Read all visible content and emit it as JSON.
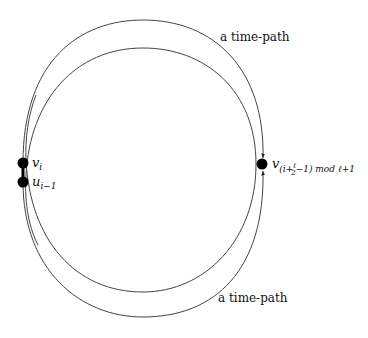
{
  "diagram": {
    "nodes": [
      {
        "id": "v_i",
        "label": "v",
        "sub": "i",
        "x": 23,
        "y": 163
      },
      {
        "id": "u_i-1",
        "label": "u",
        "sub": "i−1",
        "x": 23,
        "y": 182
      },
      {
        "id": "v_right",
        "label": "v",
        "sub": "(i+ℓ/2−1) mod ℓ+1",
        "x": 262,
        "y": 164
      }
    ],
    "edges": [
      {
        "from": "v_i",
        "to": "u_i-1",
        "style": "thick"
      }
    ],
    "paths": [
      {
        "name": "time-path-top",
        "label": "a time-path"
      },
      {
        "name": "time-path-bottom",
        "label": "a time-path"
      }
    ],
    "labels": {
      "top_path": "a time-path",
      "bottom_path": "a time-path",
      "v_i_main": "v",
      "v_i_sub": "i",
      "u_main": "u",
      "u_sub": "i−1",
      "v_right_main": "v",
      "v_right_sub_a": "(i+",
      "v_right_frac_num": "ℓ",
      "v_right_frac_den": "2",
      "v_right_sub_b": "−1) mod ℓ+1"
    }
  }
}
